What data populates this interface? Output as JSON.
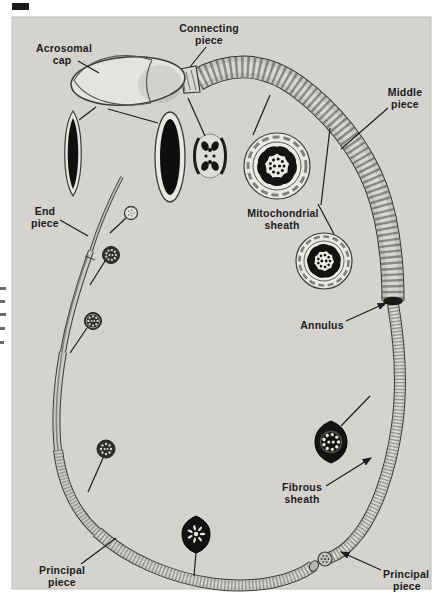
{
  "figure": {
    "palette": {
      "page": "#ffffff",
      "panel": "#d4d3cf",
      "panel-border": "#bcbbb7",
      "ink": "#1c1c1c",
      "light": "#e8e7e2",
      "mid": "#c7c6c1",
      "dark": "#121211"
    },
    "labels": {
      "acrosomal_cap": {
        "line1": "Acrosomal",
        "line2": "cap"
      },
      "connecting_piece": {
        "line1": "Connecting",
        "line2": "piece"
      },
      "middle_piece": {
        "line1": "Middle",
        "line2": "piece"
      },
      "mitochondrial_sheath": {
        "line1": "Mitochondrial",
        "line2": "sheath"
      },
      "end_piece": {
        "line1": "End",
        "line2": "piece"
      },
      "annulus": {
        "line1": "Annulus"
      },
      "fibrous_sheath": {
        "line1": "Fibrous",
        "line2": "sheath"
      },
      "principal_piece_left": {
        "line1": "Principal",
        "line2": "piece"
      },
      "principal_piece_right": {
        "line1": "Principal",
        "line2": "piece"
      }
    }
  }
}
